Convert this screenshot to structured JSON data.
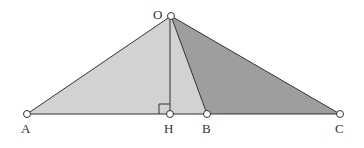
{
  "diagram": {
    "type": "geometry-triangles",
    "points": {
      "O": {
        "label": "O",
        "x": 171,
        "y": 16
      },
      "A": {
        "label": "A",
        "x": 27,
        "y": 114
      },
      "H": {
        "label": "H",
        "x": 170,
        "y": 114
      },
      "B": {
        "label": "B",
        "x": 207,
        "y": 114
      },
      "C": {
        "label": "C",
        "x": 340,
        "y": 114
      }
    },
    "regions": [
      {
        "name": "triangle-OAB",
        "fill": "#d2d2d2"
      },
      {
        "name": "triangle-OBC",
        "fill": "#9e9e9e"
      }
    ],
    "segments": [
      "OA",
      "OB",
      "OC",
      "OH",
      "AC"
    ],
    "right_angle_at": "H",
    "colors": {
      "stroke": "#333333",
      "light_fill": "#d2d2d2",
      "dark_fill": "#9e9e9e",
      "vertex_fill": "#ffffff"
    }
  }
}
